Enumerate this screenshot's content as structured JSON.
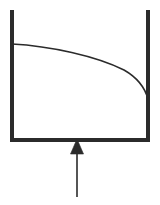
{
  "figure": {
    "title": "",
    "caption": "",
    "background_color": "#ffffff",
    "width": 160,
    "height": 205,
    "stroke_color": "#2b2b2b",
    "curve_color": "#2b2b2b",
    "arrow_color": "#2b2b2b"
  },
  "vessel": {
    "label": "",
    "shape": "u-channel",
    "wall_thickness": 4,
    "left_wall": {
      "x": 12,
      "y_top": 10,
      "y_bottom": 142
    },
    "right_wall": {
      "x": 148,
      "y_top": 10,
      "y_bottom": 142
    },
    "bottom_wall": {
      "y": 140,
      "x_left": 10,
      "x_right": 150
    }
  },
  "curve": {
    "label": "",
    "stroke_width": 1.6,
    "start": {
      "x": 12,
      "y": 44
    },
    "end": {
      "x": 148,
      "y": 99
    },
    "control_points": [
      {
        "x": 64,
        "y": 47
      },
      {
        "x": 120,
        "y": 62
      }
    ],
    "path": "M 12 44 C 50 46 96 56 124 70 C 138 78 145 88 148 99"
  },
  "arrow": {
    "label": "",
    "direction": "up",
    "shaft": {
      "x": 77,
      "y_top": 153,
      "y_bottom": 197,
      "width": 1.6
    },
    "head": {
      "apex_x": 77,
      "apex_y": 139,
      "base_y": 154,
      "half_width": 6.5,
      "filled": true
    }
  },
  "annotations": {
    "items": []
  }
}
